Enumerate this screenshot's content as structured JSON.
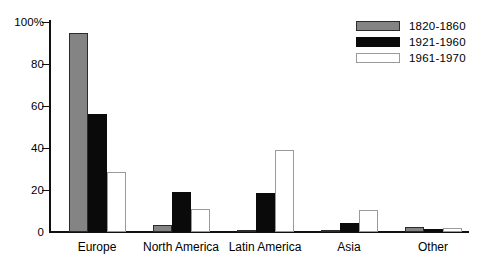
{
  "chart_data": {
    "type": "bar",
    "title": "",
    "subtitle": "",
    "xlabel": "",
    "ylabel": "",
    "ylim": [
      0,
      100
    ],
    "yticks": [
      0,
      20,
      40,
      60,
      80,
      100
    ],
    "ytick_labels": [
      "0",
      "20",
      "40",
      "60",
      "80",
      "100%"
    ],
    "grid": false,
    "legend_position": "top-right",
    "categories": [
      "Europe",
      "North America",
      "Latin America",
      "Asia",
      "Other"
    ],
    "series": [
      {
        "name": "1820-1860",
        "color": "#848484",
        "values": [
          95,
          3.5,
          0.8,
          1,
          2.5
        ]
      },
      {
        "name": "1921-1960",
        "color": "#0a0a0a",
        "values": [
          56,
          19,
          18.5,
          4.5,
          1.5
        ]
      },
      {
        "name": "1961-1970",
        "color": "#ffffff",
        "values": [
          28.5,
          11,
          39,
          10.5,
          2
        ]
      }
    ]
  }
}
